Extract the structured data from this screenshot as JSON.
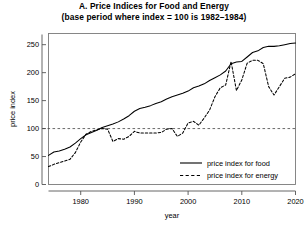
{
  "chart_data": {
    "type": "line",
    "title": "A. Price Indices for Food and Energy",
    "subtitle": "(base period where index = 100 is 1982–1984)",
    "xlabel": "year",
    "ylabel": "price index",
    "xlim": [
      1974,
      2020
    ],
    "ylim": [
      0,
      270
    ],
    "xticks": [
      1980,
      1990,
      2000,
      2010,
      2020
    ],
    "yticks": [
      0,
      50,
      100,
      150,
      200,
      250
    ],
    "grid": false,
    "legend_position": "bottom-right",
    "reference_line": {
      "y": 100,
      "style": "dashed",
      "color": "#444444"
    },
    "series": [
      {
        "name": "price index for food",
        "legend_label": "price index for food",
        "style": "solid",
        "color": "#000000",
        "x": [
          1974,
          1975,
          1976,
          1977,
          1978,
          1979,
          1980,
          1981,
          1982,
          1983,
          1984,
          1985,
          1986,
          1987,
          1988,
          1989,
          1990,
          1991,
          1992,
          1993,
          1994,
          1995,
          1996,
          1997,
          1998,
          1999,
          2000,
          2001,
          2002,
          2003,
          2004,
          2005,
          2006,
          2007,
          2008,
          2009,
          2010,
          2011,
          2012,
          2013,
          2014,
          2015,
          2016,
          2017,
          2018,
          2019,
          2020
        ],
        "values": [
          52,
          58,
          60,
          63,
          67,
          74,
          82,
          89,
          93,
          97,
          102,
          105,
          108,
          112,
          117,
          123,
          131,
          136,
          138,
          141,
          145,
          148,
          153,
          157,
          160,
          163,
          167,
          173,
          176,
          180,
          186,
          191,
          196,
          203,
          216,
          219,
          220,
          228,
          236,
          239,
          245,
          247,
          247,
          248,
          250,
          252,
          253
        ]
      },
      {
        "name": "price index for energy",
        "legend_label": "price index for energy",
        "style": "dashed",
        "color": "#000000",
        "x": [
          1974,
          1975,
          1976,
          1977,
          1978,
          1979,
          1980,
          1981,
          1982,
          1983,
          1984,
          1985,
          1986,
          1987,
          1988,
          1989,
          1990,
          1991,
          1992,
          1993,
          1994,
          1995,
          1996,
          1997,
          1998,
          1999,
          2000,
          2001,
          2002,
          2003,
          2004,
          2005,
          2006,
          2007,
          2008,
          2009,
          2010,
          2011,
          2012,
          2013,
          2014,
          2015,
          2016,
          2017,
          2018,
          2019,
          2020
        ],
        "values": [
          32,
          36,
          39,
          42,
          45,
          57,
          76,
          90,
          95,
          98,
          100,
          99,
          77,
          82,
          81,
          86,
          95,
          92,
          92,
          92,
          92,
          93,
          99,
          100,
          86,
          92,
          110,
          113,
          106,
          119,
          133,
          157,
          173,
          178,
          220,
          168,
          187,
          217,
          222,
          222,
          216,
          175,
          160,
          175,
          190,
          192,
          198
        ]
      }
    ]
  },
  "axis": {
    "y_title": "price index",
    "x_title": "year",
    "x_tick_labels": [
      "1980",
      "1990",
      "2000",
      "2010",
      "2020"
    ],
    "y_tick_labels": [
      "0",
      "50",
      "100",
      "150",
      "200",
      "250"
    ]
  }
}
